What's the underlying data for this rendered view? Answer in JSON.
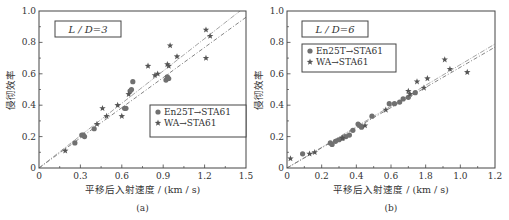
{
  "chart_data": [
    {
      "type": "scatter",
      "panel": "(a)",
      "annotation": "L / D=3",
      "xlabel": "平移后入射速度 / (km / s)",
      "ylabel": "侵彻效率",
      "xlim": [
        0,
        1.5
      ],
      "ylim": [
        0,
        1.0
      ],
      "xticks": [
        "0",
        "0.3",
        "0.6",
        "0.9",
        "1.2",
        "1.5"
      ],
      "yticks": [
        "0",
        "0.2",
        "0.4",
        "0.6",
        "0.8",
        "1.0"
      ],
      "legend": [
        "En25T→STA61",
        "WA→STA61"
      ],
      "legend_position": "lower right",
      "series": [
        {
          "name": "En25T→STA61",
          "marker": "circle",
          "x": [
            0.26,
            0.31,
            0.32,
            0.33,
            0.4,
            0.62,
            0.63,
            0.66,
            0.67,
            0.68,
            0.92,
            0.93,
            0.94
          ],
          "y": [
            0.16,
            0.21,
            0.21,
            0.2,
            0.25,
            0.38,
            0.38,
            0.49,
            0.5,
            0.55,
            0.56,
            0.58,
            0.57
          ]
        },
        {
          "name": "WA→STA61",
          "marker": "star",
          "x": [
            0.19,
            0.42,
            0.46,
            0.49,
            0.57,
            0.6,
            0.65,
            0.79,
            0.84,
            0.86,
            0.93,
            0.94,
            0.95,
            1.0,
            1.21,
            1.21,
            1.24
          ],
          "y": [
            0.11,
            0.28,
            0.38,
            0.33,
            0.4,
            0.33,
            0.47,
            0.65,
            0.59,
            0.6,
            0.66,
            0.65,
            0.78,
            0.71,
            0.88,
            0.7,
            0.84
          ]
        }
      ],
      "fit_lines": [
        {
          "name": "En25T fit",
          "style": "dash-dot",
          "x": [
            0,
            1.5
          ],
          "y": [
            0,
            1.03
          ]
        },
        {
          "name": "WA fit",
          "style": "dash-dot",
          "x": [
            0,
            1.5
          ],
          "y": [
            0,
            0.96
          ]
        }
      ]
    },
    {
      "type": "scatter",
      "panel": "(b)",
      "annotation": "L / D=6",
      "xlabel": "平移后入射速度 / (km / s)",
      "ylabel": "侵彻效率",
      "xlim": [
        0,
        1.2
      ],
      "ylim": [
        0,
        1.0
      ],
      "xticks": [
        "0",
        "0.2",
        "0.4",
        "0.6",
        "1.8",
        "1.0",
        "1.2"
      ],
      "yticks": [
        "0",
        "0.2",
        "0.4",
        "0.6",
        "0.8",
        "1.0"
      ],
      "legend": [
        "En25T→STA61",
        "WA→STA61"
      ],
      "legend_position": "upper left",
      "series": [
        {
          "name": "En25T→STA61",
          "marker": "circle",
          "x": [
            0.09,
            0.25,
            0.26,
            0.28,
            0.3,
            0.32,
            0.34,
            0.36,
            0.38,
            0.41,
            0.42,
            0.43,
            0.49,
            0.59,
            0.62,
            0.65,
            0.67,
            0.7,
            0.74
          ],
          "y": [
            0.09,
            0.16,
            0.15,
            0.17,
            0.18,
            0.19,
            0.2,
            0.21,
            0.24,
            0.28,
            0.27,
            0.26,
            0.33,
            0.41,
            0.41,
            0.42,
            0.44,
            0.45,
            0.48
          ]
        },
        {
          "name": "WA→STA61",
          "marker": "star",
          "x": [
            0.02,
            0.13,
            0.16,
            0.32,
            0.45,
            0.57,
            0.7,
            0.71,
            0.75,
            0.79,
            0.81,
            0.91,
            0.94,
            1.04
          ],
          "y": [
            0.06,
            0.09,
            0.1,
            0.19,
            0.27,
            0.37,
            0.49,
            0.47,
            0.55,
            0.51,
            0.57,
            0.69,
            0.63,
            0.61
          ]
        }
      ],
      "fit_lines": [
        {
          "name": "En25T fit",
          "style": "dash-dot",
          "x": [
            0,
            1.2
          ],
          "y": [
            0,
            0.79
          ]
        },
        {
          "name": "WA fit",
          "style": "dash-dot",
          "x": [
            0,
            1.2
          ],
          "y": [
            0,
            0.77
          ]
        }
      ]
    }
  ]
}
